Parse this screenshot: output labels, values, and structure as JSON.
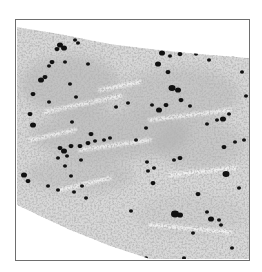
{
  "image": {
    "description": "Grayscale histology micrograph of a tissue section with scattered dark-stained nuclei",
    "colors": {
      "background": "#ffffff",
      "frame": "#6e6e6e",
      "tissue_light": "#d8d8d8",
      "tissue_mid": "#a9a9a9",
      "tissue_dark": "#7a7a7a",
      "nucleus": "#111111"
    },
    "frame": {
      "x": 15,
      "y": 19,
      "width": 234,
      "height": 241
    },
    "tissue_outline": [
      [
        17,
        27
      ],
      [
        60,
        34
      ],
      [
        110,
        44
      ],
      [
        160,
        50
      ],
      [
        200,
        54
      ],
      [
        249,
        58
      ],
      [
        249,
        259
      ],
      [
        150,
        259
      ],
      [
        110,
        246
      ],
      [
        70,
        230
      ],
      [
        40,
        216
      ],
      [
        17,
        205
      ]
    ],
    "dense_regions": [
      {
        "cx": 70,
        "cy": 85,
        "rx": 50,
        "ry": 30,
        "opacity": 0.45
      },
      {
        "cx": 180,
        "cy": 95,
        "rx": 60,
        "ry": 28,
        "opacity": 0.4
      },
      {
        "cx": 110,
        "cy": 135,
        "rx": 80,
        "ry": 25,
        "opacity": 0.45
      },
      {
        "cx": 200,
        "cy": 145,
        "rx": 45,
        "ry": 25,
        "opacity": 0.35
      },
      {
        "cx": 80,
        "cy": 175,
        "rx": 55,
        "ry": 18,
        "opacity": 0.35
      },
      {
        "cx": 190,
        "cy": 215,
        "rx": 55,
        "ry": 22,
        "opacity": 0.2
      }
    ],
    "streaks": [
      [
        45,
        112,
        120,
        96
      ],
      [
        80,
        150,
        150,
        140
      ],
      [
        150,
        120,
        230,
        110
      ],
      [
        60,
        190,
        110,
        178
      ],
      [
        170,
        175,
        235,
        168
      ],
      [
        100,
        90,
        140,
        82
      ],
      [
        150,
        225,
        230,
        232
      ],
      [
        30,
        140,
        75,
        130
      ]
    ],
    "nuclei": [
      [
        60,
        45,
        3
      ],
      [
        64,
        48,
        3
      ],
      [
        57,
        49,
        2.5
      ],
      [
        75,
        40,
        2
      ],
      [
        78,
        43,
        2
      ],
      [
        52,
        62,
        2.5
      ],
      [
        49,
        66,
        2
      ],
      [
        65,
        62,
        2
      ],
      [
        41,
        80,
        3
      ],
      [
        45,
        77,
        2.5
      ],
      [
        33,
        94,
        2.5
      ],
      [
        49,
        102,
        2
      ],
      [
        76,
        97,
        2
      ],
      [
        70,
        84,
        2
      ],
      [
        88,
        64,
        2
      ],
      [
        155,
        43,
        2
      ],
      [
        162,
        53,
        3
      ],
      [
        180,
        54,
        2.5
      ],
      [
        170,
        56,
        2
      ],
      [
        196,
        54,
        2
      ],
      [
        233,
        55,
        2
      ],
      [
        209,
        60,
        2
      ],
      [
        158,
        64,
        3
      ],
      [
        168,
        72,
        2.5
      ],
      [
        172,
        88,
        3.5
      ],
      [
        178,
        90,
        3
      ],
      [
        166,
        105,
        2.5
      ],
      [
        181,
        100,
        2.5
      ],
      [
        159,
        110,
        3
      ],
      [
        223,
        119,
        3
      ],
      [
        190,
        106,
        2
      ],
      [
        217,
        120,
        2
      ],
      [
        229,
        114,
        2
      ],
      [
        207,
        124,
        2
      ],
      [
        30,
        114,
        2.5
      ],
      [
        33,
        125,
        3
      ],
      [
        91,
        134,
        2.5
      ],
      [
        72,
        122,
        2
      ],
      [
        136,
        140,
        2
      ],
      [
        146,
        128,
        2
      ],
      [
        152,
        105,
        2
      ],
      [
        116,
        107,
        2
      ],
      [
        128,
        103,
        2
      ],
      [
        64,
        151,
        3
      ],
      [
        60,
        148,
        2.5
      ],
      [
        71,
        146,
        2.5
      ],
      [
        80,
        146,
        2.5
      ],
      [
        88,
        143,
        2.5
      ],
      [
        95,
        141,
        2
      ],
      [
        104,
        140,
        2
      ],
      [
        110,
        138,
        2
      ],
      [
        58,
        158,
        2
      ],
      [
        67,
        156,
        2
      ],
      [
        81,
        160,
        2
      ],
      [
        24,
        175,
        3
      ],
      [
        28,
        181,
        2.5
      ],
      [
        65,
        166,
        2
      ],
      [
        71,
        176,
        2
      ],
      [
        148,
        171,
        2
      ],
      [
        154,
        168,
        2
      ],
      [
        180,
        158,
        2.5
      ],
      [
        174,
        160,
        2
      ],
      [
        147,
        162,
        2
      ],
      [
        226,
        174,
        3.5
      ],
      [
        153,
        183,
        2.5
      ],
      [
        244,
        140,
        2
      ],
      [
        235,
        142,
        2
      ],
      [
        198,
        194,
        2.5
      ],
      [
        211,
        219,
        3
      ],
      [
        175,
        214,
        4
      ],
      [
        180,
        215,
        3
      ],
      [
        207,
        212,
        2
      ],
      [
        219,
        220,
        2
      ],
      [
        239,
        188,
        2
      ],
      [
        221,
        225,
        2
      ],
      [
        193,
        233,
        2
      ],
      [
        232,
        248,
        2
      ],
      [
        184,
        258,
        2
      ],
      [
        146,
        258,
        2
      ],
      [
        48,
        186,
        2
      ],
      [
        58,
        190,
        2
      ],
      [
        74,
        192,
        2
      ],
      [
        82,
        186,
        2
      ],
      [
        131,
        211,
        2
      ],
      [
        86,
        198,
        2
      ],
      [
        224,
        147,
        2.5
      ],
      [
        242,
        72,
        2
      ],
      [
        246,
        96,
        2
      ]
    ]
  }
}
